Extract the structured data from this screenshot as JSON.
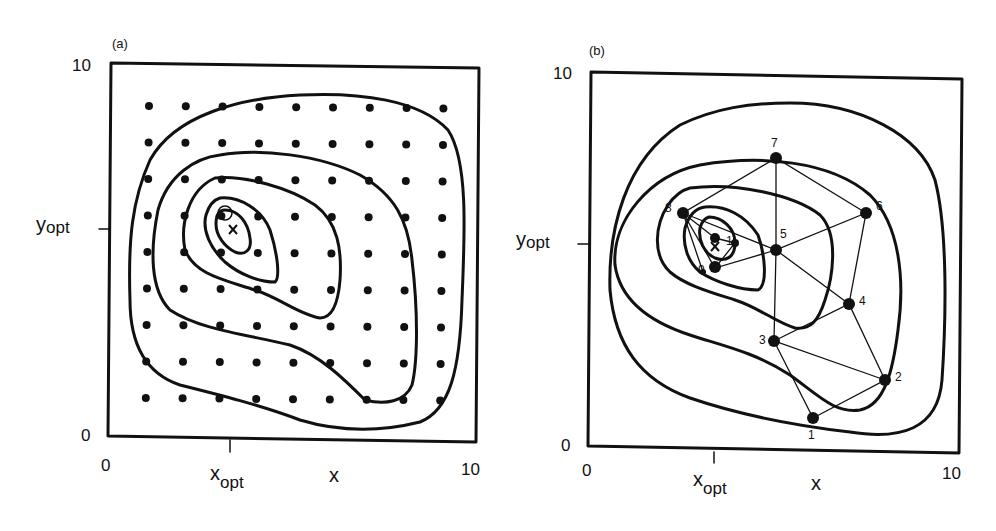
{
  "panel_a": {
    "tag": "(a)",
    "y_top": "10",
    "y_bottom": "0",
    "x_left": "0",
    "x_right": "10",
    "y_opt_main": "y",
    "y_opt_sub": "opt",
    "x_opt_main": "x",
    "x_opt_sub": "opt",
    "x_axis_var": "x",
    "optimum_marker": "x",
    "description": "Grid search: 9x9 lattice of sample points over response contours"
  },
  "panel_b": {
    "tag": "(b)",
    "y_top": "10",
    "y_bottom": "0",
    "x_left": "0",
    "x_right": "10",
    "y_opt_main": "y",
    "y_opt_sub": "opt",
    "x_opt_main": "x",
    "x_opt_sub": "opt",
    "x_axis_var": "x",
    "optimum_marker": "x",
    "points": [
      {
        "label": "1"
      },
      {
        "label": "2"
      },
      {
        "label": "3"
      },
      {
        "label": "4"
      },
      {
        "label": "5"
      },
      {
        "label": "6"
      },
      {
        "label": "7"
      },
      {
        "label": "8"
      },
      {
        "label": "9"
      },
      {
        "label": "1"
      }
    ],
    "description": "Simplex search path over response contours"
  },
  "colors": {
    "ink": "#111111",
    "background": "#ffffff"
  }
}
